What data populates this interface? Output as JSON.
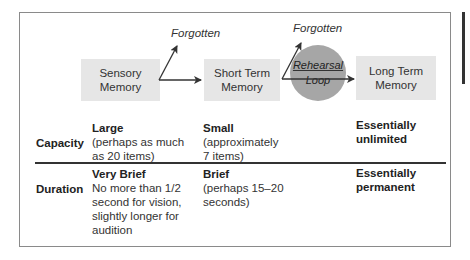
{
  "diagram": {
    "boxes": {
      "sensory": "Sensory\nMemory",
      "short_term": "Short Term\nMemory",
      "long_term": "Long Term\nMemory"
    },
    "rehearsal_loop": {
      "line1": "Rehearsal",
      "line2": "Loop"
    },
    "forgotten_labels": [
      "Forgotten",
      "Forgotten"
    ],
    "colors": {
      "box_fill": "#e6e6e6",
      "circle_fill": "#a6a6a6",
      "arrow": "#333333",
      "frame": "#8a8a8a"
    }
  },
  "table": {
    "rows": [
      {
        "label": "Capacity",
        "cells": [
          {
            "head": "Large",
            "body": "(perhaps as much\nas 20 items)"
          },
          {
            "head": "Small",
            "body": "(approximately\n7 items)"
          },
          {
            "head": "Essentially\nunlimited",
            "body": ""
          }
        ]
      },
      {
        "label": "Duration",
        "cells": [
          {
            "head": "Very Brief",
            "body": "No more than 1/2\nsecond for vision,\nslightly longer for\naudition"
          },
          {
            "head": "Brief",
            "body": "(perhaps 15–20\nseconds)"
          },
          {
            "head": "Essentially\npermanent",
            "body": ""
          }
        ]
      }
    ]
  }
}
